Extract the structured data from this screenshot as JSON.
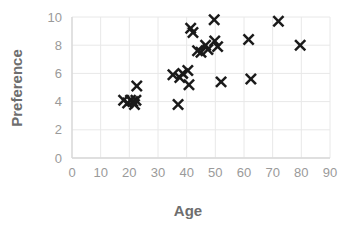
{
  "chart_data": {
    "type": "scatter",
    "title": "",
    "xlabel": "Age",
    "ylabel": "Preference",
    "xlim": [
      0,
      90
    ],
    "ylim": [
      0,
      10
    ],
    "xticks": [
      "0",
      "10",
      "20",
      "30",
      "40",
      "50",
      "60",
      "70",
      "80",
      "90"
    ],
    "yticks": [
      "0",
      "2",
      "4",
      "6",
      "8",
      "10"
    ],
    "grid": true,
    "legend": "none",
    "marker": "x-cross",
    "marker_color": "#1a1a1a",
    "grid_color": "#e8e8e8",
    "axis_color": "#d9d9d9",
    "label_color": "#6e6e6e",
    "tick_color": "#9a9a9a",
    "background": "#ffffff",
    "series": [
      {
        "name": "Preference vs Age",
        "points": [
          {
            "x": 18.0,
            "y": 4.1
          },
          {
            "x": 19.4,
            "y": 3.9
          },
          {
            "x": 20.4,
            "y": 4.1
          },
          {
            "x": 21.2,
            "y": 4.0
          },
          {
            "x": 21.8,
            "y": 3.8
          },
          {
            "x": 22.3,
            "y": 4.1
          },
          {
            "x": 22.6,
            "y": 5.1
          },
          {
            "x": 35.2,
            "y": 5.9
          },
          {
            "x": 37.0,
            "y": 3.8
          },
          {
            "x": 37.6,
            "y": 5.7
          },
          {
            "x": 38.6,
            "y": 6.0
          },
          {
            "x": 40.4,
            "y": 6.2
          },
          {
            "x": 40.8,
            "y": 5.2
          },
          {
            "x": 41.4,
            "y": 9.2
          },
          {
            "x": 42.2,
            "y": 8.9
          },
          {
            "x": 43.8,
            "y": 7.6
          },
          {
            "x": 45.0,
            "y": 7.5
          },
          {
            "x": 46.6,
            "y": 8.0
          },
          {
            "x": 47.4,
            "y": 7.7
          },
          {
            "x": 49.6,
            "y": 9.8
          },
          {
            "x": 49.8,
            "y": 8.3
          },
          {
            "x": 50.8,
            "y": 7.9
          },
          {
            "x": 52.0,
            "y": 5.4
          },
          {
            "x": 61.6,
            "y": 8.4
          },
          {
            "x": 62.4,
            "y": 5.6
          },
          {
            "x": 72.0,
            "y": 9.7
          },
          {
            "x": 79.6,
            "y": 8.0
          }
        ]
      }
    ]
  }
}
